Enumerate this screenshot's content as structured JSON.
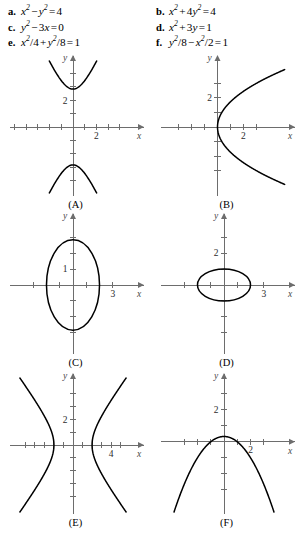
{
  "equations": {
    "left_column": [
      {
        "tag": "a.",
        "latex_parts": [
          {
            "t": "x",
            "sup": "2"
          },
          {
            "op": "−"
          },
          {
            "t": "y",
            "sup": "2"
          },
          {
            "op": "="
          },
          {
            "n": "4"
          }
        ],
        "plain": "x2 - y2 = 4"
      },
      {
        "tag": "c.",
        "latex_parts": [
          {
            "t": "y",
            "sup": "2"
          },
          {
            "op": "−"
          },
          {
            "n": "3"
          },
          {
            "t": "x"
          },
          {
            "op": "="
          },
          {
            "n": "0"
          }
        ],
        "plain": "y2 - 3x = 0"
      },
      {
        "tag": "e.",
        "latex_parts": [
          {
            "t": "x",
            "sup": "2"
          },
          {
            "n": "/4"
          },
          {
            "op": "+"
          },
          {
            "t": "y",
            "sup": "2"
          },
          {
            "n": "/8"
          },
          {
            "op": "="
          },
          {
            "n": "1"
          }
        ],
        "plain": "x2/4 + y2/8 = 1"
      }
    ],
    "right_column": [
      {
        "tag": "b.",
        "latex_parts": [
          {
            "t": "x",
            "sup": "2"
          },
          {
            "op": "+"
          },
          {
            "n": "4"
          },
          {
            "t": "y",
            "sup": "2"
          },
          {
            "op": "="
          },
          {
            "n": "4"
          }
        ],
        "plain": "x2 + 4y2 = 4"
      },
      {
        "tag": "d.",
        "latex_parts": [
          {
            "t": "x",
            "sup": "2"
          },
          {
            "op": "+"
          },
          {
            "n": "3"
          },
          {
            "t": "y"
          },
          {
            "op": "="
          },
          {
            "n": "1"
          }
        ],
        "plain": "x2 + 3y = 1"
      },
      {
        "tag": "f.",
        "latex_parts": [
          {
            "t": "y",
            "sup": "2"
          },
          {
            "n": "/8"
          },
          {
            "op": "−"
          },
          {
            "t": "x",
            "sup": "2"
          },
          {
            "n": "/2"
          },
          {
            "op": "="
          },
          {
            "n": "1"
          }
        ],
        "plain": "y2/8 - x2/2 = 1"
      }
    ]
  },
  "chart_data": [
    {
      "id": "A",
      "label": "(A)",
      "type": "line",
      "curve_kind": "hyperbola-vertical",
      "equation": "y^2/8 - x^2/2 = 1",
      "matches_equation_tag": "f.",
      "xlabel": "x",
      "ylabel": "y",
      "xlim": [
        -5.2,
        5.2
      ],
      "ylim": [
        -5.0,
        5.0
      ],
      "grid": false,
      "x_tick_labels": [
        {
          "value": 2,
          "text": "2"
        }
      ],
      "y_tick_labels": [
        {
          "value": 2,
          "text": "2"
        }
      ],
      "x_ticks": [
        -5,
        -4,
        -3,
        -2,
        -1,
        1,
        2,
        3,
        4
      ],
      "y_ticks": [
        -4,
        -3,
        -2,
        -1,
        1,
        2,
        3,
        4
      ],
      "params": {
        "a2": 8,
        "b2": 2,
        "vertex_y": 2.83
      }
    },
    {
      "id": "B",
      "label": "(B)",
      "type": "line",
      "curve_kind": "parabola-rightward",
      "equation": "y^2 - 3x = 0",
      "matches_equation_tag": "c.",
      "xlabel": "x",
      "ylabel": "y",
      "xlim": [
        -4.2,
        5.2
      ],
      "ylim": [
        -4.6,
        4.6
      ],
      "grid": false,
      "x_tick_labels": [
        {
          "value": 2,
          "text": "2"
        }
      ],
      "y_tick_labels": [
        {
          "value": 2,
          "text": "2"
        }
      ],
      "x_ticks": [
        -3,
        -2,
        -1,
        1,
        2,
        3
      ],
      "y_ticks": [
        -3,
        -2,
        -1,
        1,
        2,
        3
      ],
      "params": {
        "coefficient": 3,
        "vertex": [
          0,
          0
        ]
      }
    },
    {
      "id": "C",
      "label": "(C)",
      "type": "line",
      "curve_kind": "ellipse-tall",
      "equation": "x^2/4 + y^2/8 = 1",
      "matches_equation_tag": "e.",
      "xlabel": "x",
      "ylabel": "y",
      "xlim": [
        -4.6,
        4.6
      ],
      "ylim": [
        -4.2,
        4.2
      ],
      "grid": false,
      "x_tick_labels": [
        {
          "value": 3,
          "text": "3"
        }
      ],
      "y_tick_labels": [
        {
          "value": 1,
          "text": "1"
        }
      ],
      "x_ticks": [
        -3,
        -2,
        -1,
        1,
        2,
        3
      ],
      "y_ticks": [
        -3,
        -2,
        -1,
        1,
        2,
        3
      ],
      "params": {
        "semi_x": 2,
        "semi_y": 2.83
      }
    },
    {
      "id": "D",
      "label": "(D)",
      "type": "line",
      "curve_kind": "ellipse-wide",
      "equation": "x^2 + 4y^2 = 4",
      "matches_equation_tag": "b.",
      "xlabel": "x",
      "ylabel": "y",
      "xlim": [
        -4.6,
        4.6
      ],
      "ylim": [
        -4.2,
        4.2
      ],
      "grid": false,
      "x_tick_labels": [
        {
          "value": 3,
          "text": "3"
        }
      ],
      "y_tick_labels": [
        {
          "value": 2,
          "text": "2"
        }
      ],
      "x_ticks": [
        -3,
        -2,
        -1,
        1,
        2,
        3
      ],
      "y_ticks": [
        -3,
        -2,
        -1,
        1,
        2,
        3
      ],
      "params": {
        "semi_x": 2,
        "semi_y": 1
      }
    },
    {
      "id": "E",
      "label": "(E)",
      "type": "line",
      "curve_kind": "hyperbola-horizontal",
      "equation": "x^2 - y^2 = 4",
      "matches_equation_tag": "a.",
      "xlabel": "x",
      "ylabel": "y",
      "xlim": [
        -6.4,
        6.4
      ],
      "ylim": [
        -5.2,
        5.2
      ],
      "grid": false,
      "x_tick_labels": [
        {
          "value": 4,
          "text": "4"
        }
      ],
      "y_tick_labels": [
        {
          "value": 2,
          "text": "2"
        }
      ],
      "x_ticks": [
        -5,
        -4,
        -3,
        -2,
        -1,
        1,
        2,
        3,
        4,
        5
      ],
      "y_ticks": [
        -4,
        -3,
        -2,
        -1,
        1,
        2,
        3,
        4
      ],
      "params": {
        "a2": 4,
        "b2": 4,
        "vertex_x": 2
      }
    },
    {
      "id": "F",
      "label": "(F)",
      "type": "line",
      "curve_kind": "parabola-downward",
      "equation": "x^2 + 3y = 1",
      "matches_equation_tag": "d.",
      "xlabel": "x",
      "ylabel": "y",
      "xlim": [
        -4.6,
        4.6
      ],
      "ylim": [
        -4.4,
        4.0
      ],
      "grid": false,
      "x_tick_labels": [
        {
          "value": 2,
          "text": "2"
        }
      ],
      "y_tick_labels": [
        {
          "value": 2,
          "text": "2"
        }
      ],
      "x_ticks": [
        -3,
        -2,
        -1,
        1,
        2,
        3
      ],
      "y_ticks": [
        -3,
        -2,
        -1,
        1,
        2,
        3
      ],
      "params": {
        "vertex": [
          0,
          0.333
        ],
        "roots": [
          -1,
          1
        ],
        "form": "y = (1 - x^2)/3"
      }
    }
  ]
}
